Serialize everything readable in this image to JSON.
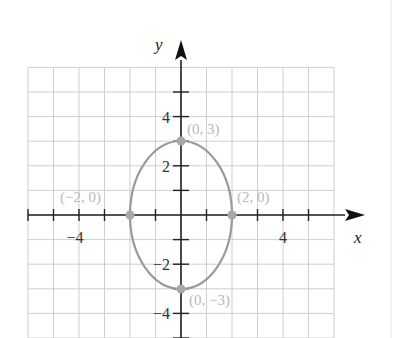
{
  "chart_data": {
    "type": "line",
    "title": "",
    "xlabel": "x",
    "ylabel": "y",
    "xlim": [
      -6,
      6
    ],
    "ylim": [
      -5,
      6
    ],
    "grid": true,
    "x_tick_labels": [
      {
        "value": -4,
        "label": "−4"
      },
      {
        "value": 4,
        "label": "4"
      }
    ],
    "y_tick_labels": [
      {
        "value": 4,
        "label": "4"
      },
      {
        "value": 2,
        "label": "2"
      },
      {
        "value": -2,
        "label": "−2"
      },
      {
        "value": -4,
        "label": "−4"
      }
    ],
    "series": [
      {
        "name": "ellipse x^2/4 + y^2/9 = 1",
        "shape": "ellipse",
        "center": [
          0,
          0
        ],
        "semi_axis_x": 2,
        "semi_axis_y": 3,
        "color": "#9a9a9a"
      }
    ],
    "points": [
      {
        "x": 0,
        "y": 3,
        "label": "(0, 3)"
      },
      {
        "x": 2,
        "y": 0,
        "label": "(2, 0)"
      },
      {
        "x": -2,
        "y": 0,
        "label": "(−2, 0)"
      },
      {
        "x": 0,
        "y": -3,
        "label": "(0, −3)"
      }
    ],
    "colors": {
      "curve": "#9a9a9a",
      "point": "#a8a8a8",
      "point_label": "#b8b8b8",
      "grid": "#c8c8c8",
      "axis": "#222222"
    }
  }
}
